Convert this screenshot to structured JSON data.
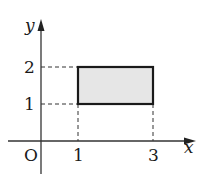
{
  "diagram": {
    "axes": {
      "x_label": "x",
      "y_label": "y",
      "origin_label": "O",
      "x_ticks": [
        "1",
        "3"
      ],
      "y_ticks": [
        "1",
        "2"
      ]
    },
    "rectangle": {
      "x_range": [
        1,
        3
      ],
      "y_range": [
        1,
        2
      ],
      "fill": "#e6e6e6",
      "stroke": "#1a1a1a"
    },
    "guides": "dashed"
  }
}
